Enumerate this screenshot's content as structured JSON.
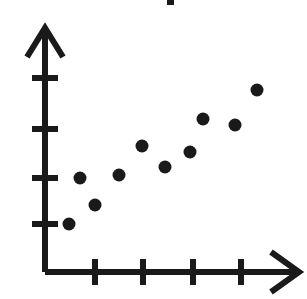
{
  "figure": {
    "width": 307,
    "height": 299,
    "background_color": "#ffffff",
    "ink_color": "#1a1a1a",
    "title_fragment_note": "cropped-title-remnant"
  },
  "chart_data": {
    "type": "scatter",
    "title": "",
    "subtitle": "",
    "xlabel": "",
    "ylabel": "",
    "xlim": [
      0,
      5.3
    ],
    "ylim": [
      0,
      5.0
    ],
    "grid": false,
    "legend": false,
    "legend_position": "none",
    "xticklabels": [
      "",
      "",
      "",
      ""
    ],
    "yticklabels": [
      "",
      "",
      "",
      ""
    ],
    "xticks": [
      1,
      2,
      3,
      4
    ],
    "yticks": [
      1,
      2,
      3,
      4
    ],
    "marker": "circle",
    "marker_color": "#1a1a1a",
    "marker_size": 13,
    "point_count": 10,
    "trend": "increasing",
    "annotations": [],
    "series": [
      {
        "name": "data",
        "x": [
          0.5,
          1.0,
          0.7,
          1.5,
          2.0,
          2.5,
          3.0,
          3.3,
          4.0,
          4.4
        ],
        "y": [
          1.0,
          1.4,
          1.9,
          2.0,
          2.6,
          2.2,
          2.5,
          3.1,
          3.0,
          3.7
        ]
      }
    ]
  },
  "axes": {
    "origin": {
      "x": 45,
      "y": 272
    },
    "x_axis": {
      "name": "x-axis",
      "end": {
        "x": 300,
        "y": 272
      },
      "arrow": true,
      "tick_positions_px": [
        95,
        143,
        193,
        241
      ],
      "tick_half_length": 13
    },
    "y_axis": {
      "name": "y-axis",
      "end": {
        "x": 45,
        "y": 27
      },
      "arrow": true,
      "tick_positions_px": [
        78,
        129,
        178,
        224
      ],
      "tick_half_length": 13
    }
  },
  "points_px": [
    {
      "cx": 69,
      "cy": 224
    },
    {
      "cx": 95,
      "cy": 205
    },
    {
      "cx": 80,
      "cy": 178
    },
    {
      "cx": 119,
      "cy": 175
    },
    {
      "cx": 142,
      "cy": 146
    },
    {
      "cx": 165,
      "cy": 167
    },
    {
      "cx": 190,
      "cy": 152
    },
    {
      "cx": 203,
      "cy": 119
    },
    {
      "cx": 235,
      "cy": 125
    },
    {
      "cx": 257,
      "cy": 90
    }
  ],
  "title_fragment_px": {
    "x": 167,
    "y": 0,
    "width": 7,
    "height": 5
  },
  "alt_text": "Scatter plot with ten black dots showing an increasing trend, drawn with arrowed x and y axes and four unlabeled tick marks on each axis."
}
